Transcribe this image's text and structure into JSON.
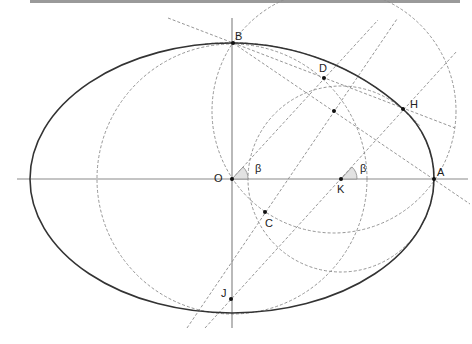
{
  "diagram": {
    "points": [
      {
        "id": "O",
        "label": "O",
        "x": 232,
        "y": 179,
        "lx": 214,
        "ly": 182
      },
      {
        "id": "A",
        "label": "A",
        "x": 434,
        "y": 179,
        "lx": 437,
        "ly": 176
      },
      {
        "id": "B",
        "label": "B",
        "x": 233,
        "y": 43,
        "lx": 235,
        "ly": 40
      },
      {
        "id": "D",
        "label": "D",
        "x": 324,
        "y": 78,
        "lx": 319,
        "ly": 72
      },
      {
        "id": "H",
        "label": "H",
        "x": 403,
        "y": 109,
        "lx": 410,
        "ly": 108
      },
      {
        "id": "K",
        "label": "K",
        "x": 341,
        "y": 179,
        "lx": 337,
        "ly": 193
      },
      {
        "id": "C",
        "label": "C",
        "x": 265,
        "y": 212,
        "lx": 265,
        "ly": 227
      },
      {
        "id": "J",
        "label": "J",
        "x": 231,
        "y": 299,
        "lx": 221,
        "ly": 297
      },
      {
        "id": "M",
        "label": "",
        "x": 334,
        "y": 111,
        "lx": 0,
        "ly": 0
      }
    ],
    "angles": [
      {
        "label": "β",
        "at": "O",
        "lx": 255,
        "ly": 172
      },
      {
        "label": "β",
        "at": "K",
        "lx": 360,
        "ly": 172
      }
    ],
    "colors": {
      "curve": "#333333",
      "axis": "#8a8a8a",
      "dashed": "#8a8a8a",
      "point": "#111111"
    }
  }
}
